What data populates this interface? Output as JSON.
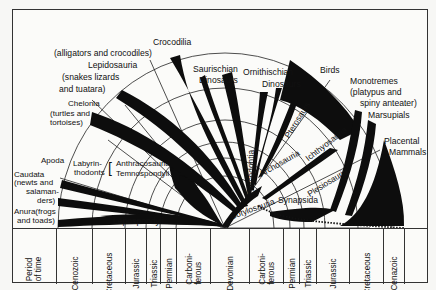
{
  "diagram": {
    "type": "phylogenetic-fan-diagram"
  },
  "labels": {
    "crocodilia": "Crocodilia",
    "crocodilia_sub": "(alligators and crocodiles)",
    "lepidosauria": "Lepidosauria",
    "lepidosauria_sub1": "(snakes lizards",
    "lepidosauria_sub2": "and tuatara)",
    "chelonia": "Chelonia",
    "chelonia_sub1": "(turtles and",
    "chelonia_sub2": "tortoises)",
    "saurischian1": "Saurischian",
    "saurischian2": "Dinosaurs",
    "ornithischian1": "Ornithischian",
    "ornithischian2": "Dinosaurs",
    "birds": "Birds",
    "monotremes": "Monotremes",
    "monotremes_sub1": "(platypus and",
    "monotremes_sub2": "spiny anteater)",
    "marsupials": "Marsupials",
    "placental1": "Placental",
    "placental2": "Mammals",
    "thecodontia": "Thecodontia",
    "pterosaurs": "Pterosaurs",
    "archosauria": "Archosauria",
    "ichthyosauria": "Ichthyosauria",
    "plesiosauria": "Plesiosauria",
    "cotylosauria": "Cotylosauria",
    "synapsida": "Synapsida",
    "apoda": "Apoda",
    "caudata1": "Caudata",
    "caudata2": "(newts and",
    "caudata3": "salaman-",
    "caudata4": "ders)",
    "anura1": "Anura(frogs",
    "anura2": "and toads)",
    "labyrinthodonts1": "Labyrin-",
    "labyrinthodonts2": "thodonts",
    "anthracosauria": "Anthracosauria",
    "temnospondyli": "Temnospondyli",
    "lepospondyli": "Lepospondyli"
  },
  "timeline": {
    "header": [
      "Period",
      "of time"
    ],
    "periods": [
      {
        "l1": "Cenozoic",
        "l2": ""
      },
      {
        "l1": "Cretaceous",
        "l2": ""
      },
      {
        "l1": "Jurassic",
        "l2": ""
      },
      {
        "l1": "Triassic",
        "l2": ""
      },
      {
        "l1": "Permian",
        "l2": ""
      },
      {
        "l1": "Carboni-",
        "l2": "ferous"
      },
      {
        "l1": "Devonian",
        "l2": ""
      },
      {
        "l1": "Carboni-",
        "l2": "ferous"
      },
      {
        "l1": "Permian",
        "l2": ""
      },
      {
        "l1": "Triassic",
        "l2": ""
      },
      {
        "l1": "Jurassic",
        "l2": ""
      },
      {
        "l1": "Cretaceous",
        "l2": ""
      },
      {
        "l1": "Cenazoic",
        "l2": ""
      },
      {
        "l1": "",
        "l2": ""
      }
    ]
  }
}
